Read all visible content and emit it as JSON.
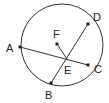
{
  "diagram": {
    "circle": {
      "cx": 62,
      "cy": 45,
      "r": 41
    },
    "points": {
      "A": {
        "x": 20,
        "y": 47,
        "label": "A",
        "lx": 6,
        "ly": 52
      },
      "B": {
        "x": 51,
        "y": 83,
        "label": "B",
        "lx": 45,
        "ly": 99
      },
      "C": {
        "x": 88,
        "y": 65,
        "label": "C",
        "lx": 94,
        "ly": 73
      },
      "D": {
        "x": 88,
        "y": 24,
        "label": "D",
        "lx": 93,
        "ly": 21
      },
      "E": {
        "x": 67,
        "y": 59,
        "label": "E",
        "lx": 64,
        "ly": 74
      },
      "F": {
        "x": 57,
        "y": 44,
        "label": "F",
        "lx": 53,
        "ly": 38
      }
    },
    "segments": [
      [
        "A",
        "C"
      ],
      [
        "B",
        "D"
      ],
      [
        "F",
        "E"
      ]
    ],
    "colors": {
      "stroke": "#333333",
      "point": "#222222"
    }
  }
}
